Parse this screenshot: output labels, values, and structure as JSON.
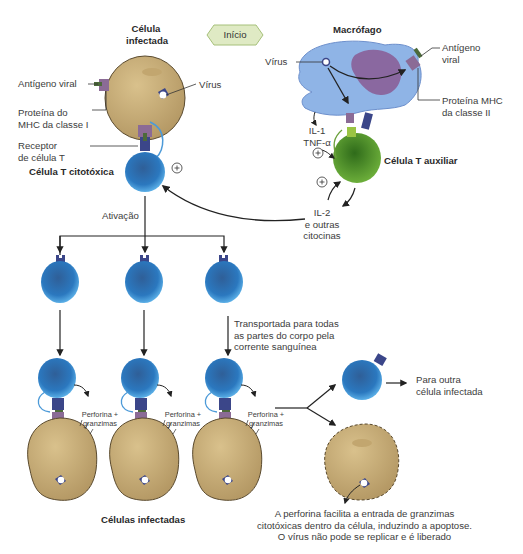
{
  "diagram": {
    "start_badge": "Início",
    "infected_cell": {
      "title_line1": "Célula",
      "title_line2": "infectada",
      "labels": {
        "viral_antigen": "Antígeno viral",
        "virus": "Vírus",
        "mhc1_line1": "Proteína do",
        "mhc1_line2": "MHC da classe I",
        "tcr_line1": "Receptor",
        "tcr_line2": "de célula T"
      }
    },
    "cytotoxic_t_cell": {
      "label": "Célula T citotóxica"
    },
    "macrophage": {
      "title": "Macrófago",
      "labels": {
        "virus": "Vírus",
        "viral_antigen_line1": "Antígeno",
        "viral_antigen_line2": "viral",
        "mhc2_line1": "Proteína MHC",
        "mhc2_line2": "da classe II",
        "il1": "IL-1",
        "tnf": "TNF-α"
      }
    },
    "helper_t_cell": {
      "label": "Célula T auxiliar"
    },
    "cytokines": {
      "line1": "IL-2",
      "line2": "e outras",
      "line3": "citocinas"
    },
    "plus_sign": "+",
    "activation": "Ativação",
    "transport": {
      "line1": "Transportada para todas",
      "line2": "as partes do corpo pela",
      "line3": "corrente sanguínea"
    },
    "perforin": {
      "line1": "Perforina +",
      "line2": "granzimas"
    },
    "next_cell": {
      "line1": "Para outra",
      "line2": "célula infectada"
    },
    "infected_cells_label": "Células infectadas",
    "apoptosis_note": {
      "line1": "A perforina facilita a entrada de granzimas",
      "line2": "citotóxicas dentro da célula, induzindo a apoptose.",
      "line3": "O vírus não pode se replicar e é liberado"
    },
    "colors": {
      "infected_cell_fill": "#c9ad73",
      "infected_cell_stroke": "#5a4a2e",
      "t_cell_outer": "#5aaee6",
      "t_cell_inner": "#2a69a8",
      "macrophage_fill": "#8fb4e6",
      "macrophage_nucleus": "#8a5a93",
      "helper_fill": "#4f9a2a",
      "receptor_dark": "#3b4689",
      "mhc_purple": "#8b6b96",
      "badge_fill": "#dfeac4",
      "badge_stroke": "#a6c07a",
      "arrow": "#222222"
    }
  }
}
